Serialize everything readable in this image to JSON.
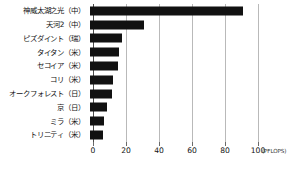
{
  "chart_data": {
    "type": "bar",
    "orientation": "horizontal",
    "title": "",
    "xlabel": "(PFLOPS)",
    "ylabel": "",
    "unit": "(PFLOPS)",
    "xlim": [
      0,
      100
    ],
    "xticks": [
      0,
      20,
      40,
      60,
      80,
      100
    ],
    "xtick_labels": [
      "0",
      "20",
      "40",
      "60",
      "80",
      "100"
    ],
    "grid": true,
    "legend": false,
    "bar_color": "#111111",
    "categories": [
      "神威太湖之光（中）",
      "天河2（中）",
      "ピズダイント（瑞）",
      "タイタン（米）",
      "セコイア（米）",
      "コリ（米）",
      "オークフォレスト（日）",
      "京（日）",
      "ミラ（米）",
      "トリニティ（米）"
    ],
    "values": [
      93,
      33,
      19.6,
      17.6,
      17.2,
      14,
      13.6,
      10.5,
      8.6,
      8.1
    ]
  },
  "axis": {
    "gridline_color": "#b9b9b9",
    "axis_color": "#4a4a4a"
  }
}
